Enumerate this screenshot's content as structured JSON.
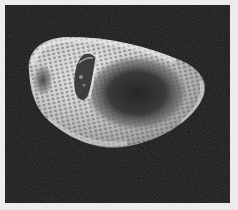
{
  "image": {
    "kind": "SEM micrograph",
    "subject": "pollen grain",
    "colors": {
      "background_paper": "#ececec",
      "frame_background": "#151515",
      "grain_highlight": "#e2e2e2",
      "grain_mid": "#9a9a9a",
      "grain_shadow": "#3a3a3a"
    },
    "frame": {
      "x": 5,
      "y": 5,
      "width": 225,
      "height": 198
    }
  }
}
